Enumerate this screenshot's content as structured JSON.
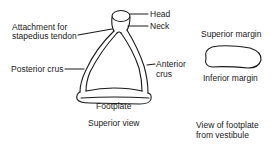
{
  "figure": {
    "superior_view": {
      "caption": "Superior view",
      "labels": {
        "attachment_line1": "Attachment for",
        "attachment_line2": "stapedius tendon",
        "head": "Head",
        "neck": "Neck",
        "posterior_crus": "Posterior crus",
        "anterior_line1": "Anterior",
        "anterior_line2": "crus",
        "footplate": "Footplate"
      }
    },
    "footplate_view": {
      "caption_line1": "View of footplate",
      "caption_line2": "from vestibule",
      "labels": {
        "superior_margin": "Superior margin",
        "inferior_margin": "Inferior margin"
      }
    }
  }
}
